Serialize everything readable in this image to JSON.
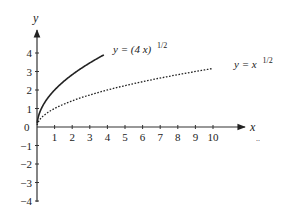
{
  "chart_data": {
    "type": "line",
    "title": "",
    "xlabel": "x",
    "ylabel": "y",
    "xlim": [
      0,
      10.5
    ],
    "ylim": [
      -4,
      4.5
    ],
    "grid": false,
    "legend_position": "inline labels at curve ends",
    "x_ticks": [
      "1",
      "2",
      "3",
      "4",
      "5",
      "6",
      "7",
      "8",
      "9",
      "10"
    ],
    "y_ticks": [
      "-4",
      "-3",
      "-2",
      "-1",
      "0",
      "1",
      "2",
      "3",
      "4"
    ],
    "series": [
      {
        "name": "y = (4 x)^1/2",
        "label_main": "y = (4 x)",
        "label_exp": "1/2",
        "style": "solid",
        "x": [
          0,
          0.25,
          0.5,
          1,
          1.5,
          2,
          2.5,
          3,
          3.5,
          4
        ],
        "values": [
          0,
          1.0,
          1.41,
          2.0,
          2.45,
          2.83,
          3.16,
          3.46,
          3.74,
          4.0
        ]
      },
      {
        "name": "y = x^1/2",
        "label_main": "y = x",
        "label_exp": "1/2",
        "style": "dotted",
        "x": [
          0,
          0.25,
          0.5,
          1,
          2,
          3,
          4,
          5,
          6,
          7,
          8,
          9,
          10
        ],
        "values": [
          0,
          0.5,
          0.71,
          1.0,
          1.41,
          1.73,
          2.0,
          2.24,
          2.45,
          2.65,
          2.83,
          3.0,
          3.16
        ]
      }
    ],
    "annotations": [
      "..."
    ]
  },
  "labels": {
    "x_axis": "x",
    "y_axis": "y",
    "origin": "0",
    "series1_main": "y = (4 x)",
    "series1_exp": "1/2",
    "series2_main": "y = x",
    "series2_exp": "1/2",
    "ellipsis": "..",
    "xt": [
      "1",
      "2",
      "3",
      "4",
      "5",
      "6",
      "7",
      "8",
      "9",
      "10"
    ],
    "yt_pos": [
      "1",
      "2",
      "3",
      "4"
    ],
    "yt_neg": [
      "−1",
      "−2",
      "−3",
      "−4"
    ]
  }
}
